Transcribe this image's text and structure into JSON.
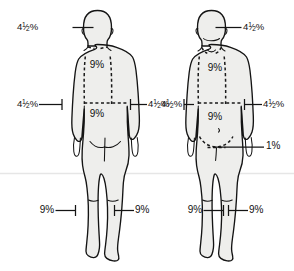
{
  "diagram": {
    "background_color": "#ffffff",
    "body_fill_color": "#eeeeec",
    "outline_color": "#141414",
    "figures": [
      {
        "view": "posterior",
        "name": "back-view-figure",
        "labels": {
          "head": "4¹⁄₂%",
          "upper_back": "9%",
          "lower_back": "9%",
          "left_arm": "4¹⁄₂%",
          "right_arm": "4¹⁄₂%",
          "left_leg": "9%",
          "right_leg": "9%"
        }
      },
      {
        "view": "anterior",
        "name": "front-view-figure",
        "labels": {
          "head": "4¹⁄₂%",
          "chest": "9%",
          "abdomen": "9%",
          "left_arm": "4¹⁄₂%",
          "right_arm": "4¹⁄₂%",
          "genitalia": "1%",
          "left_leg": "9%",
          "right_leg": "9%"
        }
      }
    ],
    "callouts": [
      {
        "id": "back-head",
        "text_parts": {
          "whole": "4",
          "num": "1",
          "den": "2",
          "pct": "%"
        },
        "display": "4¹⁄₂%",
        "x": 44,
        "y": 24,
        "align": "right"
      },
      {
        "id": "back-left-arm",
        "text_parts": {
          "whole": "4",
          "num": "1",
          "den": "2",
          "pct": "%"
        },
        "display": "4¹⁄₂%",
        "x": 10,
        "y": 101,
        "align": "right"
      },
      {
        "id": "back-right-arm",
        "text_parts": {
          "whole": "4",
          "num": "1",
          "den": "2",
          "pct": "%"
        },
        "display": "4¹⁄₂%",
        "x": 136,
        "y": 101,
        "align": "left"
      },
      {
        "id": "back-upper",
        "display": "9%",
        "x": 97,
        "y": 65,
        "align": "center"
      },
      {
        "id": "back-lower",
        "display": "9%",
        "x": 97,
        "y": 114,
        "align": "center"
      },
      {
        "id": "back-left-leg",
        "display": "9%",
        "x": 48,
        "y": 207,
        "align": "right"
      },
      {
        "id": "back-right-leg",
        "display": "9%",
        "x": 122,
        "y": 207,
        "align": "left"
      },
      {
        "id": "front-head",
        "text_parts": {
          "whole": "4",
          "num": "1",
          "den": "2",
          "pct": "%"
        },
        "display": "4¹⁄₂%",
        "x": 244,
        "y": 24,
        "align": "left"
      },
      {
        "id": "front-left-arm",
        "text_parts": {
          "whole": "4",
          "num": "1",
          "den": "2",
          "pct": "%"
        },
        "display": "4¹⁄₂%",
        "x": 155,
        "y": 101,
        "align": "right"
      },
      {
        "id": "front-right-arm",
        "text_parts": {
          "whole": "4",
          "num": "1",
          "den": "2",
          "pct": "%"
        },
        "display": "4¹⁄₂%",
        "x": 265,
        "y": 101,
        "align": "left"
      },
      {
        "id": "front-chest",
        "display": "9%",
        "x": 215,
        "y": 68,
        "align": "center"
      },
      {
        "id": "front-abdomen",
        "display": "9%",
        "x": 215,
        "y": 117,
        "align": "center"
      },
      {
        "id": "front-genitalia",
        "display": "1%",
        "x": 267,
        "y": 144,
        "align": "left"
      },
      {
        "id": "front-left-leg",
        "display": "9%",
        "x": 196,
        "y": 207,
        "align": "right"
      },
      {
        "id": "front-right-leg",
        "display": "9%",
        "x": 268,
        "y": 207,
        "align": "left"
      }
    ]
  }
}
